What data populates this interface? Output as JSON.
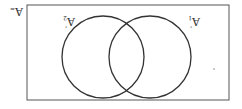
{
  "diagram": {
    "type": "venn",
    "orientation_rotation_deg": 180,
    "universe_label": "A",
    "universe_sublabel": "=",
    "sets": [
      {
        "id": "left",
        "label": "A",
        "subscript": "2",
        "prime": "'"
      },
      {
        "id": "right",
        "label": "A",
        "subscript": "1",
        "prime": "'"
      }
    ],
    "colors": {
      "stroke": "#333333",
      "frame": "#555555",
      "background": "#ffffff"
    }
  }
}
